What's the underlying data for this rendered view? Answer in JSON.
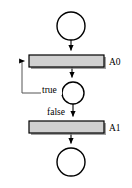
{
  "diagram": {
    "kind": "activity-flow-diagram",
    "canvas": {
      "width": 132,
      "height": 188,
      "background": "#ffffff"
    },
    "style": {
      "activity_fill": "#d0d0d0",
      "activity_stroke": "#000000",
      "shadow_color": "#808080",
      "circle_fill": "#ffffff",
      "circle_stroke": "#000000",
      "edge_color": "#000000",
      "loop_edge_color": "#555555"
    },
    "nodes": [
      {
        "id": "start",
        "type": "circle",
        "label": "",
        "cx": 71,
        "cy": 26,
        "r": 14
      },
      {
        "id": "a0",
        "type": "activity-bar",
        "label": "A0",
        "x": 29,
        "y": 55,
        "width": 75,
        "height": 12
      },
      {
        "id": "decision",
        "type": "circle",
        "label": "",
        "cx": 73,
        "cy": 93,
        "r": 11
      },
      {
        "id": "a1",
        "type": "activity-bar",
        "label": "A1",
        "x": 29,
        "y": 121,
        "width": 75,
        "height": 12
      },
      {
        "id": "end",
        "type": "circle",
        "label": "",
        "cx": 71,
        "cy": 162,
        "r": 14
      }
    ],
    "edges": [
      {
        "id": "start-to-a0",
        "from": "start",
        "to": "a0",
        "label": "",
        "arrow": true
      },
      {
        "id": "a0-to-decision",
        "from": "a0",
        "to": "decision",
        "label": "",
        "arrow": true
      },
      {
        "id": "decision-to-a0-loop",
        "from": "decision",
        "to": "a0",
        "label": "true",
        "arrow": true
      },
      {
        "id": "decision-to-a1",
        "from": "decision",
        "to": "a1",
        "label": "false",
        "arrow": true
      },
      {
        "id": "a1-to-end",
        "from": "a1",
        "to": "end",
        "label": "",
        "arrow": true
      }
    ],
    "labels": {
      "a0": "A0",
      "a1": "A1",
      "true_branch": "true",
      "false_branch": "false"
    }
  }
}
